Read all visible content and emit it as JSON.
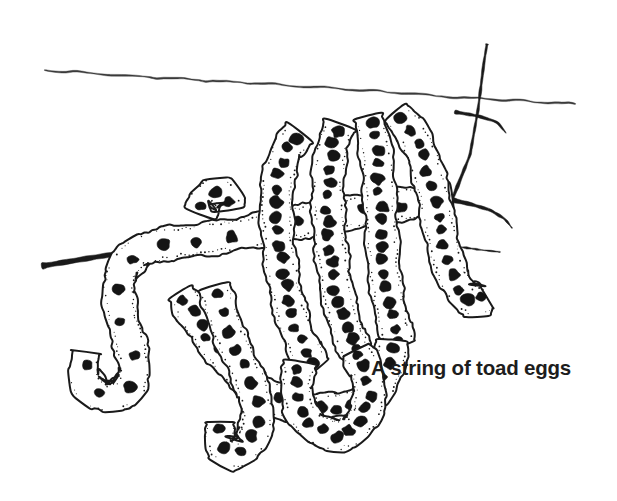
{
  "figure": {
    "caption": "A string of toad eggs",
    "medium": "pen-and-ink line drawing",
    "background_color": "#ffffff",
    "ink_color": "#1a1a1a",
    "egg_color": "#141414",
    "caption_color": "#1d1d1d",
    "water_line_color": "#3a3a3a"
  },
  "elements": {
    "water_surface_label": "water surface line",
    "twig_label": "twig",
    "twig_branch_label": "upward twig branch",
    "twig_spur_label": "forked twig spur",
    "egg_string_label": "gelatinous toad egg string",
    "egg_label": "toad egg"
  },
  "chart_data": {
    "type": "line",
    "title": "A string of toad eggs",
    "xlabel": "",
    "ylabel": "",
    "water_surface": {
      "label": "water surface line",
      "points": [
        [
          45,
          70
        ],
        [
          130,
          76
        ],
        [
          215,
          81
        ],
        [
          300,
          86
        ],
        [
          390,
          92
        ],
        [
          452,
          97
        ],
        [
          520,
          101
        ],
        [
          575,
          104
        ]
      ]
    },
    "twig_main": {
      "label": "twig",
      "points": [
        [
          42,
          266
        ],
        [
          90,
          258
        ],
        [
          140,
          250
        ],
        [
          190,
          243
        ],
        [
          245,
          236
        ],
        [
          300,
          230
        ],
        [
          355,
          222
        ],
        [
          410,
          213
        ],
        [
          452,
          200
        ],
        [
          470,
          155
        ],
        [
          478,
          110
        ],
        [
          484,
          62
        ],
        [
          487,
          44
        ]
      ]
    },
    "twig_lower_right": {
      "label": "twig right continuation",
      "points": [
        [
          452,
          200
        ],
        [
          470,
          204
        ],
        [
          490,
          210
        ],
        [
          505,
          219
        ],
        [
          512,
          228
        ]
      ]
    },
    "twig_spur": {
      "label": "forked twig spur",
      "points": [
        [
          455,
          112
        ],
        [
          478,
          116
        ],
        [
          497,
          122
        ],
        [
          506,
          133
        ]
      ]
    },
    "twig_fragment_right": {
      "label": "thin twig fragment at right",
      "points": [
        [
          437,
          244
        ],
        [
          460,
          247
        ],
        [
          482,
          250
        ],
        [
          500,
          252
        ]
      ]
    },
    "egg_string_strands": [
      {
        "name": "left hanging strand",
        "egg_count": 16,
        "path": [
          [
            452,
            198
          ],
          [
            390,
            206
          ],
          [
            330,
            216
          ],
          [
            270,
            228
          ],
          [
            215,
            238
          ],
          [
            170,
            243
          ],
          [
            140,
            250
          ],
          [
            122,
            268
          ],
          [
            118,
            292
          ],
          [
            122,
            318
          ],
          [
            130,
            344
          ],
          [
            135,
            368
          ],
          [
            130,
            388
          ],
          [
            113,
            398
          ],
          [
            92,
            392
          ],
          [
            83,
            374
          ],
          [
            86,
            352
          ]
        ]
      },
      {
        "name": "first over-twig loop",
        "egg_count": 18,
        "path": [
          [
            300,
            132
          ],
          [
            286,
            150
          ],
          [
            278,
            178
          ],
          [
            276,
            208
          ],
          [
            278,
            240
          ],
          [
            282,
            272
          ],
          [
            288,
            302
          ],
          [
            296,
            330
          ],
          [
            305,
            352
          ],
          [
            318,
            368
          ]
        ]
      },
      {
        "name": "second over-twig loop",
        "egg_count": 18,
        "path": [
          [
            340,
            124
          ],
          [
            332,
            146
          ],
          [
            328,
            174
          ],
          [
            328,
            206
          ],
          [
            330,
            240
          ],
          [
            334,
            274
          ],
          [
            340,
            306
          ],
          [
            348,
            334
          ],
          [
            358,
            356
          ]
        ]
      },
      {
        "name": "third over-twig loop",
        "egg_count": 17,
        "path": [
          [
            368,
            116
          ],
          [
            374,
            140
          ],
          [
            378,
            170
          ],
          [
            380,
            202
          ],
          [
            382,
            236
          ],
          [
            384,
            270
          ],
          [
            388,
            300
          ],
          [
            394,
            326
          ],
          [
            402,
            346
          ]
        ]
      },
      {
        "name": "right descending strand",
        "egg_count": 15,
        "path": [
          [
            395,
            112
          ],
          [
            412,
            132
          ],
          [
            424,
            158
          ],
          [
            432,
            188
          ],
          [
            438,
            220
          ],
          [
            444,
            250
          ],
          [
            452,
            276
          ],
          [
            463,
            294
          ],
          [
            476,
            302
          ],
          [
            486,
            296
          ]
        ]
      },
      {
        "name": "lower sweeping loop",
        "egg_count": 20,
        "path": [
          [
            180,
            292
          ],
          [
            196,
            318
          ],
          [
            214,
            344
          ],
          [
            234,
            368
          ],
          [
            256,
            388
          ],
          [
            282,
            402
          ],
          [
            310,
            410
          ],
          [
            338,
            410
          ],
          [
            362,
            402
          ],
          [
            380,
            386
          ],
          [
            390,
            364
          ],
          [
            392,
            340
          ]
        ]
      },
      {
        "name": "bottom hanging tip strand",
        "egg_count": 12,
        "path": [
          [
            214,
            286
          ],
          [
            222,
            314
          ],
          [
            232,
            342
          ],
          [
            244,
            368
          ],
          [
            254,
            392
          ],
          [
            258,
            414
          ],
          [
            254,
            436
          ],
          [
            242,
            452
          ],
          [
            228,
            454
          ],
          [
            220,
            440
          ],
          [
            220,
            422
          ]
        ]
      },
      {
        "name": "bottom return loop",
        "egg_count": 14,
        "path": [
          [
            300,
            362
          ],
          [
            296,
            386
          ],
          [
            300,
            410
          ],
          [
            314,
            428
          ],
          [
            334,
            436
          ],
          [
            354,
            430
          ],
          [
            366,
            414
          ],
          [
            370,
            392
          ],
          [
            366,
            370
          ],
          [
            356,
            350
          ]
        ]
      },
      {
        "name": "small stub above twig",
        "egg_count": 3,
        "path": [
          [
            200,
            214
          ],
          [
            206,
            198
          ],
          [
            216,
            190
          ],
          [
            226,
            196
          ],
          [
            228,
            210
          ]
        ]
      }
    ]
  }
}
